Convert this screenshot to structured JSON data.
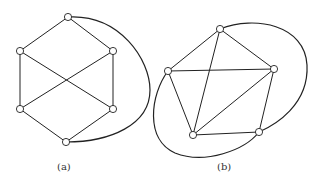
{
  "figures": [
    {
      "id": "a",
      "caption": "(a)",
      "nodes": [
        {
          "x": 68,
          "y": 17
        },
        {
          "x": 20,
          "y": 51
        },
        {
          "x": 113,
          "y": 51
        },
        {
          "x": 20,
          "y": 109
        },
        {
          "x": 113,
          "y": 109
        },
        {
          "x": 66,
          "y": 142
        }
      ],
      "edges": [
        [
          0,
          1
        ],
        [
          0,
          2
        ],
        [
          1,
          3
        ],
        [
          2,
          4
        ],
        [
          3,
          5
        ],
        [
          4,
          5
        ],
        [
          1,
          4
        ],
        [
          2,
          3
        ]
      ],
      "curves": [
        "M 68 17 C 120 14, 150 60, 150 90 C 150 125, 110 142, 66 142"
      ]
    },
    {
      "id": "b",
      "caption": "(b)",
      "nodes": [
        {
          "x": 220,
          "y": 29
        },
        {
          "x": 168,
          "y": 71
        },
        {
          "x": 274,
          "y": 69
        },
        {
          "x": 193,
          "y": 135
        },
        {
          "x": 259,
          "y": 132
        }
      ],
      "edges": [
        [
          0,
          1
        ],
        [
          0,
          2
        ],
        [
          1,
          2
        ],
        [
          0,
          3
        ],
        [
          1,
          3
        ],
        [
          2,
          3
        ],
        [
          2,
          4
        ],
        [
          3,
          4
        ]
      ],
      "curves": [
        "M 220 29 C 255 15, 305 25, 307 65 C 309 105, 275 125, 259 132",
        "M 168 71 C 150 95, 145 140, 175 153 C 205 165, 245 150, 259 132"
      ]
    }
  ]
}
